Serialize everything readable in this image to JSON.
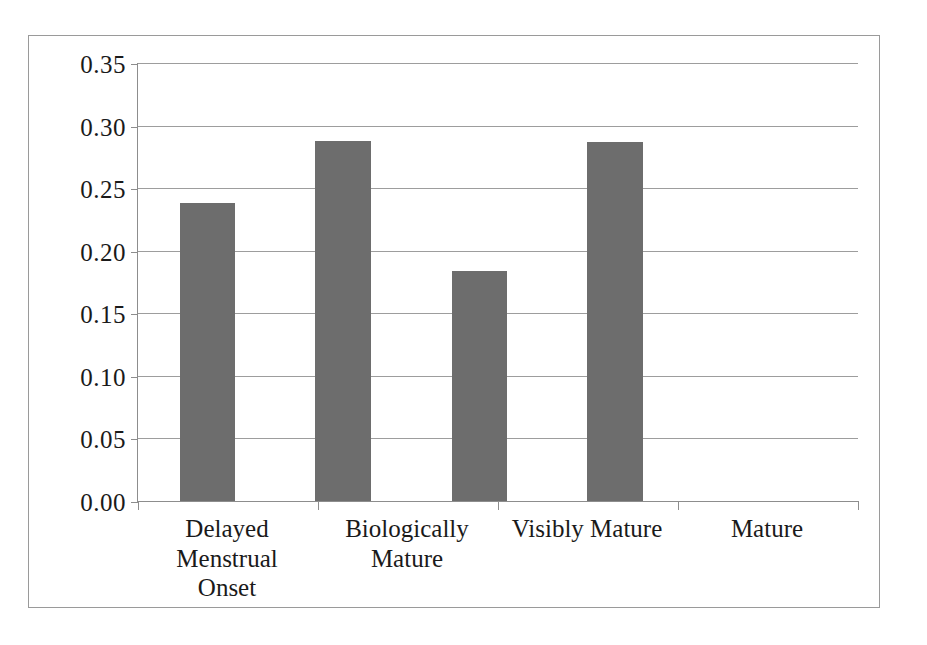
{
  "chart_data": {
    "type": "bar",
    "title": "",
    "subtitle": "",
    "xlabel": "",
    "ylabel": "",
    "categories": [
      "Delayed Menstrual Onset",
      "Biologically Mature",
      "Visibly Mature",
      "Mature"
    ],
    "category_lines": [
      [
        "Delayed Menstrual",
        "Onset"
      ],
      [
        "Biologically",
        "Mature"
      ],
      [
        "Visibly Mature"
      ],
      [
        "Mature"
      ]
    ],
    "values": [
      0.238,
      0.288,
      0.184,
      0.287
    ],
    "ylim": [
      0.0,
      0.35
    ],
    "ytick_values": [
      0.35,
      0.3,
      0.25,
      0.2,
      0.15,
      0.1,
      0.05,
      0.0
    ],
    "ytick_labels": [
      "0.35",
      "0.30",
      "0.25",
      "0.20",
      "0.15",
      "0.10",
      "0.05",
      "0.00"
    ],
    "grid": true,
    "legend": "none",
    "bar_color": "#6d6d6d",
    "gridline_color": "#9d9d9d",
    "axis_color": "#8d8d8d",
    "frame_color": "#9a9a9a",
    "background_color": "#ffffff"
  }
}
